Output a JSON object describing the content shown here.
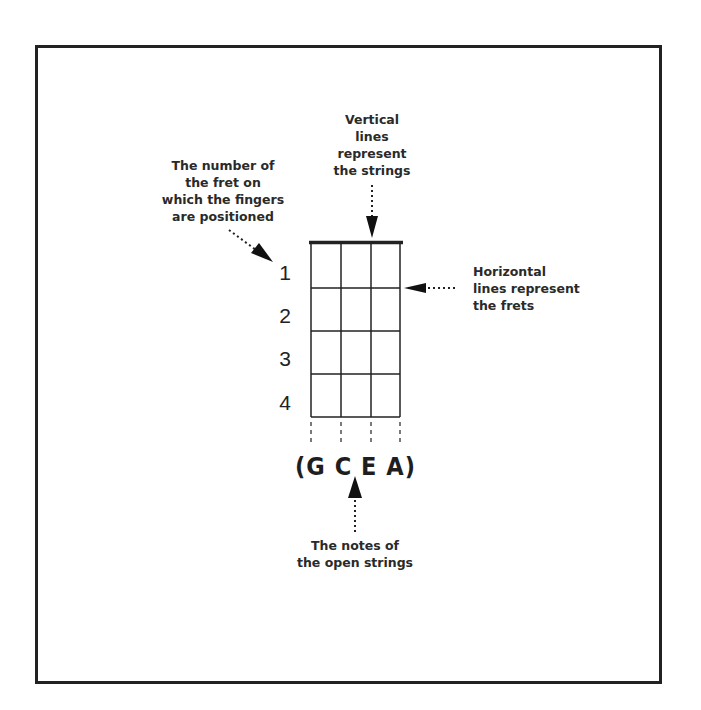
{
  "diagram": {
    "annotations": {
      "strings": [
        "Vertical",
        "lines",
        "represent",
        "the strings"
      ],
      "fret_number": [
        "The number of",
        "the fret on",
        "which the fingers",
        "are positioned"
      ],
      "frets": [
        "Horizontal",
        "lines represent",
        "the frets"
      ],
      "open_notes": [
        "The notes of",
        "the open strings"
      ]
    },
    "fret_numbers": [
      "1",
      "2",
      "3",
      "4"
    ],
    "open_string_notes": "(G C E A)",
    "grid": {
      "strings": 4,
      "frets": 4
    },
    "colors": {
      "line": "#222222",
      "background": "#ffffff",
      "text": "#2a2a2a"
    }
  }
}
